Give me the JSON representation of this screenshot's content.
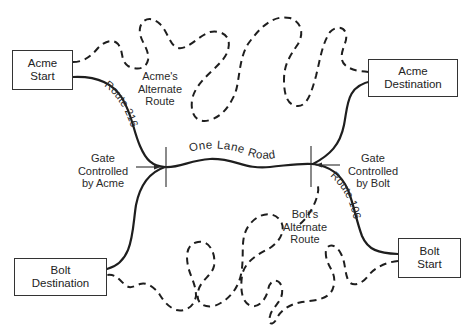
{
  "nodes": {
    "acme_start": {
      "line1": "Acme",
      "line2": "Start"
    },
    "acme_destination": {
      "line1": "Acme",
      "line2": "Destination"
    },
    "bolt_start": {
      "line1": "Bolt",
      "line2": "Start"
    },
    "bolt_destination": {
      "line1": "Bolt",
      "line2": "Destination"
    }
  },
  "routes": {
    "route_216": "Route 216",
    "route_106": "Route 106",
    "one_lane_road": "One Lane Road"
  },
  "alternates": {
    "acme": {
      "line1": "Acme's",
      "line2": "Alternate",
      "line3": "Route"
    },
    "bolt": {
      "line1": "Bolt's",
      "line2": "Alternate",
      "line3": "Route"
    }
  },
  "gates": {
    "acme": {
      "line1": "Gate",
      "line2": "Controlled",
      "line3": "by Acme"
    },
    "bolt": {
      "line1": "Gate",
      "line2": "Controlled",
      "line3": "by Bolt"
    }
  },
  "styles": {
    "line_color": "#1e1e1e",
    "background": "#ffffff"
  }
}
